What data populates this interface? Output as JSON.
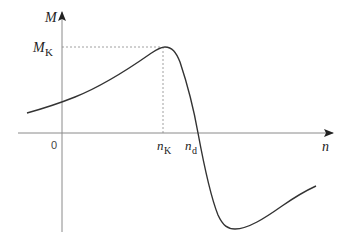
{
  "diagram": {
    "title": "",
    "y_axis": {
      "label": "M"
    },
    "x_axis": {
      "label": "n"
    },
    "origin_label": "0",
    "peak": {
      "y_label_main": "M",
      "y_label_sub": "K",
      "x_label_main": "n",
      "x_label_sub": "K"
    },
    "zero_crossing": {
      "label_main": "n",
      "label_sub": "d"
    },
    "colors": {
      "axis": "#8a8a8a",
      "curve": "#333333",
      "guide": "#888888"
    }
  }
}
